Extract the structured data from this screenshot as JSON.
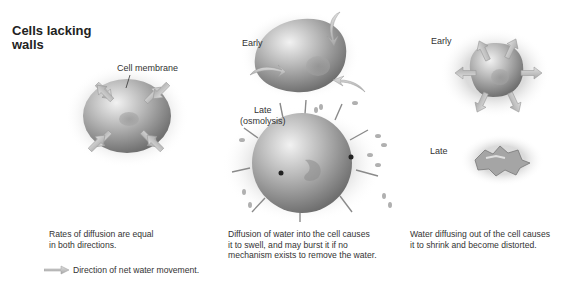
{
  "title": {
    "line1": "Cells lacking",
    "line2": "walls"
  },
  "panels": [
    {
      "id": "isotonic",
      "labels": {
        "membrane": "Cell membrane"
      },
      "caption": [
        "Rates of diffusion are equal",
        "in both directions."
      ]
    },
    {
      "id": "hypotonic",
      "labels": {
        "early": "Early",
        "late_line1": "Late",
        "late_line2": "(osmolysis)"
      },
      "caption": [
        "Diffusion of water into the cell causes",
        "it to swell, and may burst it if no",
        "mechanism exists to remove the water."
      ]
    },
    {
      "id": "hypertonic",
      "labels": {
        "early": "Early",
        "late": "Late"
      },
      "caption": [
        "Water diffusing out of the cell causes",
        "it to shrink and become distorted."
      ]
    }
  ],
  "legend": {
    "icon": "arrow-right-icon",
    "text": "Direction of net water movement."
  },
  "colors": {
    "cell_fill": "#a8a8a8",
    "cell_highlight": "#e8e8e8",
    "arrow_fill": "#c8c8c8",
    "stipple": "#9a9a9a"
  }
}
